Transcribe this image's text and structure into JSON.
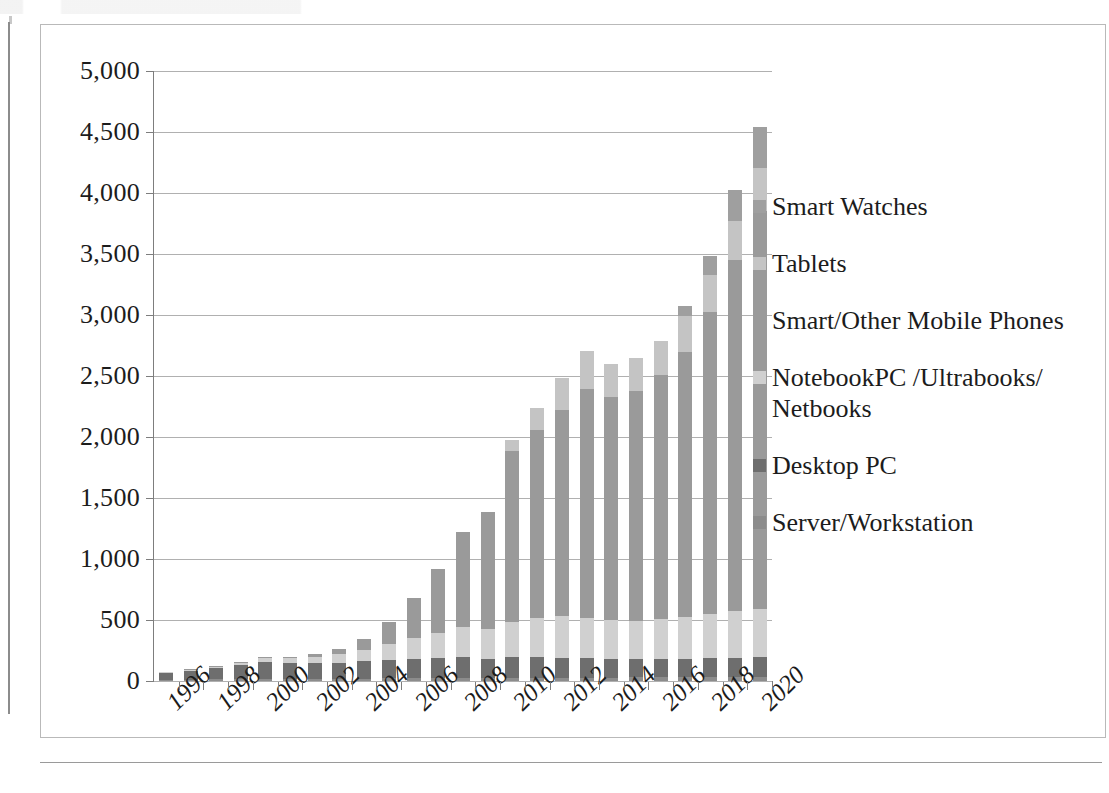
{
  "chart_data": {
    "type": "bar",
    "subtype": "stacked-column",
    "title": "",
    "xlabel": "",
    "ylabel": "",
    "ylim": [
      0,
      5000
    ],
    "ytick_step": 500,
    "grid": true,
    "legend_position": "right",
    "ytick_labels": [
      "5,000",
      "4,500",
      "4,000",
      "3,500",
      "3,000",
      "2,500",
      "2,000",
      "1,500",
      "1,000",
      "500",
      "0"
    ],
    "categories": [
      "1996",
      "1997",
      "1998",
      "1999",
      "2000",
      "2001",
      "2002",
      "2003",
      "2004",
      "2005",
      "2006",
      "2007",
      "2008",
      "2009",
      "2010",
      "2011",
      "2012",
      "2013",
      "2014",
      "2015",
      "2016",
      "2017",
      "2018",
      "2019",
      "2020"
    ],
    "xtick_labels": [
      "1996",
      "1998",
      "2000",
      "2002",
      "2004",
      "2006",
      "2008",
      "2010",
      "2012",
      "2014",
      "2016",
      "2018",
      "2020"
    ],
    "series": [
      {
        "name": "Server/Workstation",
        "color": "#8c8c8c",
        "values": [
          10,
          12,
          14,
          16,
          18,
          18,
          18,
          19,
          20,
          21,
          22,
          23,
          24,
          24,
          25,
          26,
          27,
          28,
          28,
          29,
          30,
          31,
          32,
          33,
          34
        ]
      },
      {
        "name": "Desktop PC",
        "color": "#6e6e6e",
        "values": [
          58,
          72,
          92,
          112,
          138,
          128,
          126,
          132,
          140,
          152,
          162,
          168,
          172,
          160,
          170,
          172,
          165,
          158,
          150,
          148,
          150,
          152,
          155,
          158,
          160
        ]
      },
      {
        "name": "NotebookPC /Ultrabooks/ Netbooks",
        "color": "#d0d0d0",
        "values": [
          3,
          6,
          12,
          20,
          32,
          42,
          55,
          72,
          95,
          128,
          168,
          205,
          245,
          240,
          290,
          320,
          340,
          330,
          320,
          318,
          330,
          345,
          360,
          380,
          395
        ]
      },
      {
        "name": "Smart/Other Mobile Phones",
        "color": "#9a9a9a",
        "values": [
          0,
          1,
          2,
          3,
          5,
          10,
          20,
          40,
          90,
          180,
          330,
          520,
          780,
          960,
          1400,
          1540,
          1690,
          1880,
          1830,
          1880,
          2000,
          2170,
          2480,
          2880,
          3260
        ]
      },
      {
        "name": "Tablets",
        "color": "#c4c4c4",
        "values": [
          0,
          0,
          0,
          0,
          0,
          0,
          0,
          0,
          0,
          0,
          0,
          0,
          0,
          0,
          90,
          180,
          265,
          310,
          270,
          270,
          280,
          290,
          300,
          320,
          360
        ]
      },
      {
        "name": "Smart Watches",
        "color": "#9f9f9f",
        "values": [
          0,
          0,
          0,
          0,
          0,
          0,
          0,
          0,
          0,
          0,
          0,
          0,
          0,
          0,
          0,
          0,
          0,
          0,
          0,
          0,
          0,
          90,
          160,
          250,
          330
        ]
      }
    ],
    "totals": [
      71,
      91,
      120,
      151,
      193,
      198,
      219,
      263,
      345,
      482,
      682,
      916,
      1221,
      1384,
      1975,
      2238,
      2487,
      2706,
      2598,
      2645,
      2790,
      3078,
      3487,
      4021,
      4539
    ]
  },
  "legend": {
    "items": [
      {
        "label": "Smart Watches",
        "color": "#9f9f9f"
      },
      {
        "label": "Tablets",
        "color": "#c4c4c4"
      },
      {
        "label": "Smart/Other Mobile Phones",
        "color": "#9a9a9a"
      },
      {
        "label": "NotebookPC /Ultrabooks/\nNetbooks",
        "color": "#d0d0d0"
      },
      {
        "label": "Desktop PC",
        "color": "#6e6e6e"
      },
      {
        "label": "Server/Workstation",
        "color": "#8c8c8c"
      }
    ]
  }
}
